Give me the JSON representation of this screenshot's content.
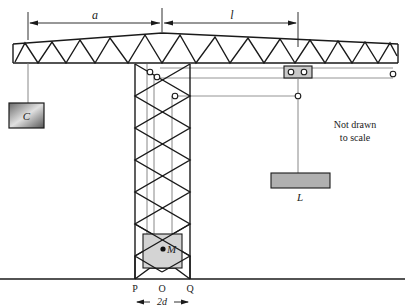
{
  "diagram": {
    "type": "tower-crane",
    "labels": {
      "dim_a": "a",
      "dim_l": "l",
      "counterweight": "C",
      "load": "L",
      "tower_mass": "M",
      "point_p": "P",
      "point_o": "O",
      "point_q": "Q",
      "base_width": "2d",
      "note_line1": "Not drawn",
      "note_line2": "to scale"
    },
    "colors": {
      "line": "#1a1a1a",
      "thin_line": "#7a7a7a",
      "counterweight_fill_dark": "#5a5a5a",
      "counterweight_fill_light": "#d8d8d8",
      "load_fill": "#b0b0b0",
      "mass_fill": "#d4d4d4",
      "background": "#ffffff"
    }
  }
}
